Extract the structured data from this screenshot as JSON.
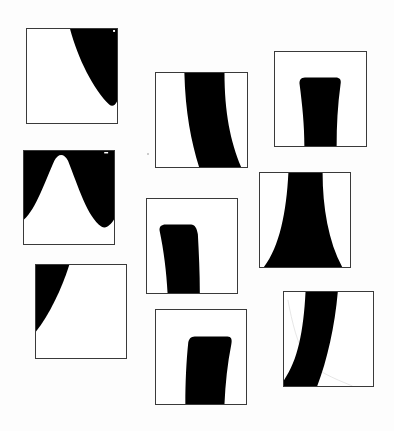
{
  "canvas": {
    "width": 394,
    "height": 431,
    "background": "#fdfdfd"
  },
  "colors": {
    "border": "#3a3a3a",
    "fill": "#000000",
    "tile_bg": "#ffffff",
    "faint_line": "#cfcfcf"
  },
  "tiles": [
    {
      "id": 1,
      "shape": "right-edge-curved-wedge",
      "x": 26,
      "y": 28,
      "w": 92,
      "h": 96
    },
    {
      "id": 2,
      "shape": "curved-vertical-band",
      "x": 155,
      "y": 72,
      "w": 93,
      "h": 96
    },
    {
      "id": 3,
      "shape": "rounded-top-pillar",
      "x": 274,
      "y": 51,
      "w": 93,
      "h": 96
    },
    {
      "id": 4,
      "shape": "inverted-bell-curve",
      "x": 23,
      "y": 150,
      "w": 92,
      "h": 95
    },
    {
      "id": 5,
      "shape": "rounded-top-pillar-left",
      "x": 146,
      "y": 198,
      "w": 92,
      "h": 96
    },
    {
      "id": 6,
      "shape": "flared-stem",
      "x": 259,
      "y": 172,
      "w": 92,
      "h": 96
    },
    {
      "id": 7,
      "shape": "top-left-wedge",
      "x": 35,
      "y": 264,
      "w": 92,
      "h": 95
    },
    {
      "id": 8,
      "shape": "rounded-top-pillar-right",
      "x": 155,
      "y": 309,
      "w": 92,
      "h": 96
    },
    {
      "id": 9,
      "shape": "diagonal-curved-band",
      "x": 283,
      "y": 291,
      "w": 91,
      "h": 96
    }
  ]
}
